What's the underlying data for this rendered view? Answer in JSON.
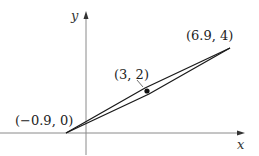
{
  "figure": {
    "axes": {
      "x_label": "x",
      "y_label": "y",
      "color": "#8a8a8a"
    },
    "points": {
      "left_vertex": {
        "label": "(−0.9, 0)"
      },
      "right_vertex": {
        "label": "(6.9, 4)"
      },
      "center_point": {
        "label": "(3, 2)"
      }
    },
    "line_color": "#1a1a1a"
  }
}
